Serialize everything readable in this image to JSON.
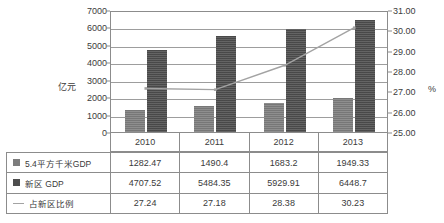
{
  "chart_data": {
    "type": "bar",
    "title": "",
    "subtitle": "",
    "xlabel": "",
    "ylabel": "亿元",
    "y2label": "%",
    "categories": [
      "2010",
      "2011",
      "2012",
      "2013"
    ],
    "ylim": [
      0,
      7000
    ],
    "y2lim": [
      25.0,
      31.0
    ],
    "y_ticks": [
      "0",
      "1000",
      "2000",
      "3000",
      "4000",
      "5000",
      "6000",
      "7000"
    ],
    "y2_ticks": [
      "25.00",
      "26.00",
      "27.00",
      "28.00",
      "29.00",
      "30.00",
      "31.00"
    ],
    "grid": true,
    "legend_position": "table-below",
    "series": [
      {
        "name": "5.4平方千米GDP",
        "type": "bar",
        "axis": "left",
        "color": "#7d7d7d",
        "values": [
          1282.47,
          1490.4,
          1683.2,
          1949.33
        ],
        "value_labels": [
          "1282.47",
          "1490.4",
          "1683.2",
          "1949.33"
        ]
      },
      {
        "name": "新区 GDP",
        "type": "bar",
        "axis": "left",
        "color": "#4e4e4e",
        "values": [
          4707.52,
          5484.35,
          5929.91,
          6448.7
        ],
        "value_labels": [
          "4707.52",
          "5484.35",
          "5929.91",
          "6448.7"
        ]
      },
      {
        "name": "占新区比例",
        "type": "line",
        "axis": "right",
        "color": "#a3a3a3",
        "values": [
          27.24,
          27.18,
          28.38,
          30.23
        ],
        "value_labels": [
          "27.24",
          "27.18",
          "28.38",
          "30.23"
        ]
      }
    ]
  },
  "axes": {
    "left_title": "亿元",
    "right_title": "%"
  },
  "table": {
    "year_headers": [
      "2010",
      "2011",
      "2012",
      "2013"
    ],
    "rows": [
      {
        "marker": "square-light-swatch",
        "label": "5.4平方千米GDP",
        "values": [
          "1282.47",
          "1490.4",
          "1683.2",
          "1949.33"
        ]
      },
      {
        "marker": "square-dark-swatch",
        "label": "新区 GDP",
        "values": [
          "4707.52",
          "5484.35",
          "5929.91",
          "6448.7"
        ]
      },
      {
        "marker": "line-swatch",
        "label": "占新区比例",
        "values": [
          "27.24",
          "27.18",
          "28.38",
          "30.23"
        ]
      }
    ]
  },
  "colors": {
    "series1": "#7d7d7d",
    "series2": "#4e4e4e",
    "line": "#a3a3a3",
    "grid": "#9d9d9d",
    "frame": "#8c8c8c",
    "text": "#3a3a3a",
    "background": "#ffffff"
  }
}
